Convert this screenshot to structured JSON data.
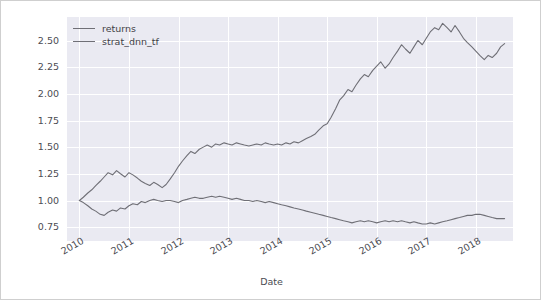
{
  "chart_data": {
    "type": "line",
    "title": "",
    "xlabel": "Date",
    "ylabel": "",
    "grid": true,
    "legend_position": "upper left",
    "xlim": [
      2009.75,
      2018.75
    ],
    "ylim": [
      0.62,
      2.72
    ],
    "yticks": [
      "0.75",
      "1.00",
      "1.25",
      "1.50",
      "1.75",
      "2.00",
      "2.25",
      "2.50"
    ],
    "ytick_values": [
      0.75,
      1.0,
      1.25,
      1.5,
      1.75,
      2.0,
      2.25,
      2.5
    ],
    "xticks": [
      "2010",
      "2011",
      "2012",
      "2013",
      "2014",
      "2015",
      "2016",
      "2017",
      "2018"
    ],
    "xtick_values": [
      2010,
      2011,
      2012,
      2013,
      2014,
      2015,
      2016,
      2017,
      2018
    ],
    "xtick_rotation": -30,
    "series": [
      {
        "name": "returns",
        "color": "#6f6f76",
        "x": [
          2010.0,
          2010.08,
          2010.17,
          2010.25,
          2010.33,
          2010.42,
          2010.5,
          2010.58,
          2010.67,
          2010.75,
          2010.83,
          2010.92,
          2011.0,
          2011.08,
          2011.17,
          2011.25,
          2011.33,
          2011.42,
          2011.5,
          2011.58,
          2011.67,
          2011.75,
          2011.83,
          2011.92,
          2012.0,
          2012.08,
          2012.17,
          2012.25,
          2012.33,
          2012.42,
          2012.5,
          2012.58,
          2012.67,
          2012.75,
          2012.83,
          2012.92,
          2013.0,
          2013.08,
          2013.17,
          2013.25,
          2013.33,
          2013.42,
          2013.5,
          2013.58,
          2013.67,
          2013.75,
          2013.83,
          2013.92,
          2014.0,
          2014.08,
          2014.17,
          2014.25,
          2014.33,
          2014.42,
          2014.5,
          2014.58,
          2014.67,
          2014.75,
          2014.83,
          2014.92,
          2015.0,
          2015.08,
          2015.17,
          2015.25,
          2015.33,
          2015.42,
          2015.5,
          2015.58,
          2015.67,
          2015.75,
          2015.83,
          2015.92,
          2016.0,
          2016.08,
          2016.17,
          2016.25,
          2016.33,
          2016.42,
          2016.5,
          2016.58,
          2016.67,
          2016.75,
          2016.83,
          2016.92,
          2017.0,
          2017.08,
          2017.17,
          2017.25,
          2017.33,
          2017.42,
          2017.5,
          2017.58,
          2017.67,
          2017.75,
          2017.83,
          2017.92,
          2018.0,
          2018.08,
          2018.17,
          2018.25,
          2018.33,
          2018.42,
          2018.5,
          2018.58
        ],
        "values": [
          1.0,
          0.98,
          0.95,
          0.92,
          0.9,
          0.87,
          0.86,
          0.89,
          0.91,
          0.9,
          0.93,
          0.92,
          0.95,
          0.97,
          0.96,
          0.99,
          0.98,
          1.0,
          1.01,
          1.0,
          0.99,
          1.0,
          1.0,
          0.99,
          0.98,
          1.0,
          1.01,
          1.02,
          1.03,
          1.02,
          1.02,
          1.03,
          1.04,
          1.03,
          1.04,
          1.03,
          1.02,
          1.01,
          1.02,
          1.01,
          1.0,
          1.0,
          0.99,
          1.0,
          0.99,
          0.98,
          0.99,
          0.98,
          0.97,
          0.96,
          0.95,
          0.94,
          0.93,
          0.92,
          0.91,
          0.9,
          0.89,
          0.88,
          0.87,
          0.86,
          0.85,
          0.84,
          0.83,
          0.82,
          0.81,
          0.8,
          0.79,
          0.8,
          0.81,
          0.8,
          0.81,
          0.8,
          0.79,
          0.8,
          0.81,
          0.8,
          0.81,
          0.8,
          0.81,
          0.8,
          0.79,
          0.8,
          0.79,
          0.78,
          0.78,
          0.79,
          0.78,
          0.79,
          0.8,
          0.81,
          0.82,
          0.83,
          0.84,
          0.85,
          0.86,
          0.86,
          0.87,
          0.87,
          0.86,
          0.85,
          0.84,
          0.83,
          0.83,
          0.83
        ]
      },
      {
        "name": "strat_dnn_tf",
        "color": "#6f6f76",
        "x": [
          2010.0,
          2010.08,
          2010.17,
          2010.25,
          2010.33,
          2010.42,
          2010.5,
          2010.58,
          2010.67,
          2010.75,
          2010.83,
          2010.92,
          2011.0,
          2011.08,
          2011.17,
          2011.25,
          2011.33,
          2011.42,
          2011.5,
          2011.58,
          2011.67,
          2011.75,
          2011.83,
          2011.92,
          2012.0,
          2012.08,
          2012.17,
          2012.25,
          2012.33,
          2012.42,
          2012.5,
          2012.58,
          2012.67,
          2012.75,
          2012.83,
          2012.92,
          2013.0,
          2013.08,
          2013.17,
          2013.25,
          2013.33,
          2013.42,
          2013.5,
          2013.58,
          2013.67,
          2013.75,
          2013.83,
          2013.92,
          2014.0,
          2014.08,
          2014.17,
          2014.25,
          2014.33,
          2014.42,
          2014.5,
          2014.58,
          2014.67,
          2014.75,
          2014.83,
          2014.92,
          2015.0,
          2015.08,
          2015.17,
          2015.25,
          2015.33,
          2015.42,
          2015.5,
          2015.58,
          2015.67,
          2015.75,
          2015.83,
          2015.92,
          2016.0,
          2016.08,
          2016.17,
          2016.25,
          2016.33,
          2016.42,
          2016.5,
          2016.58,
          2016.67,
          2016.75,
          2016.83,
          2016.92,
          2017.0,
          2017.08,
          2017.17,
          2017.25,
          2017.33,
          2017.42,
          2017.5,
          2017.58,
          2017.67,
          2017.75,
          2017.83,
          2017.92,
          2018.0,
          2018.08,
          2018.17,
          2018.25,
          2018.33,
          2018.42,
          2018.5,
          2018.58
        ],
        "values": [
          1.0,
          1.03,
          1.07,
          1.1,
          1.14,
          1.18,
          1.22,
          1.26,
          1.24,
          1.28,
          1.25,
          1.22,
          1.26,
          1.24,
          1.21,
          1.18,
          1.16,
          1.14,
          1.17,
          1.15,
          1.12,
          1.15,
          1.2,
          1.26,
          1.32,
          1.37,
          1.42,
          1.46,
          1.44,
          1.48,
          1.5,
          1.52,
          1.5,
          1.53,
          1.52,
          1.54,
          1.53,
          1.52,
          1.54,
          1.53,
          1.52,
          1.51,
          1.52,
          1.53,
          1.52,
          1.54,
          1.53,
          1.52,
          1.53,
          1.52,
          1.54,
          1.53,
          1.55,
          1.54,
          1.56,
          1.58,
          1.6,
          1.62,
          1.66,
          1.7,
          1.72,
          1.78,
          1.86,
          1.94,
          1.98,
          2.04,
          2.02,
          2.08,
          2.14,
          2.18,
          2.16,
          2.22,
          2.26,
          2.3,
          2.24,
          2.28,
          2.34,
          2.4,
          2.46,
          2.42,
          2.38,
          2.44,
          2.5,
          2.46,
          2.52,
          2.58,
          2.62,
          2.6,
          2.66,
          2.62,
          2.58,
          2.64,
          2.58,
          2.52,
          2.48,
          2.44,
          2.4,
          2.36,
          2.32,
          2.36,
          2.34,
          2.38,
          2.44,
          2.47
        ]
      }
    ]
  },
  "legend": {
    "items": [
      {
        "label": "returns"
      },
      {
        "label": "strat_dnn_tf"
      }
    ]
  },
  "axis": {
    "xlabel": "Date"
  }
}
